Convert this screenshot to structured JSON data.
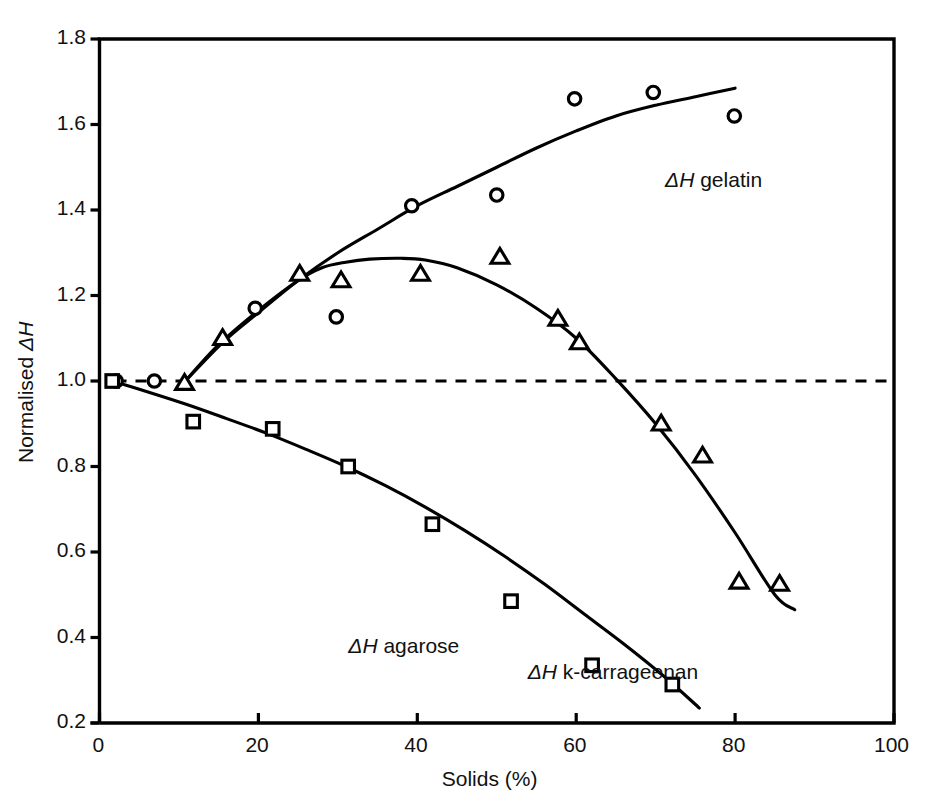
{
  "chart_data": {
    "type": "scatter",
    "title": "",
    "subtitle": "",
    "xlabel": "Solids (%)",
    "ylabel_prefix": "Normalised ",
    "ylabel_symbol": "ΔH",
    "xlim": [
      0,
      100
    ],
    "ylim": [
      0.2,
      1.8
    ],
    "xticks": [
      0,
      20,
      40,
      60,
      80,
      100
    ],
    "xticklabels": [
      "0",
      "20",
      "40",
      "60",
      "80",
      "100"
    ],
    "yticks": [
      0.2,
      0.4,
      0.6,
      0.8,
      1.0,
      1.2,
      1.4,
      1.6,
      1.8
    ],
    "yticklabels": [
      "0.2",
      "0.4",
      "0.6",
      "0.8",
      "1.0",
      "1.2",
      "1.4",
      "1.6",
      "1.8"
    ],
    "grid": false,
    "legend_position": "inline-annotations",
    "reference_line": {
      "y": 1.0,
      "style": "dashed",
      "color": "#000000"
    },
    "frame_color": "#000000",
    "series": [
      {
        "name": "ΔH gelatin",
        "marker": "circle",
        "label": "ΔH gelatin",
        "label_prefix": "ΔH",
        "label_suffix": " gelatin",
        "label_x": 80.0,
        "label_y": 1.465,
        "points": [
          {
            "x": 2.1,
            "y": 1.0
          },
          {
            "x": 6.9,
            "y": 1.0
          },
          {
            "x": 19.6,
            "y": 1.17
          },
          {
            "x": 29.8,
            "y": 1.15
          },
          {
            "x": 39.3,
            "y": 1.41
          },
          {
            "x": 50.0,
            "y": 1.435
          },
          {
            "x": 59.8,
            "y": 1.66
          },
          {
            "x": 69.7,
            "y": 1.675
          },
          {
            "x": 79.9,
            "y": 1.62
          }
        ],
        "fit_curve": [
          {
            "x": 10.8,
            "y": 1.0
          },
          {
            "x": 15.5,
            "y": 1.09
          },
          {
            "x": 20.0,
            "y": 1.16
          },
          {
            "x": 25.0,
            "y": 1.235
          },
          {
            "x": 30.0,
            "y": 1.3
          },
          {
            "x": 35.0,
            "y": 1.355
          },
          {
            "x": 40.0,
            "y": 1.41
          },
          {
            "x": 45.0,
            "y": 1.455
          },
          {
            "x": 50.0,
            "y": 1.5
          },
          {
            "x": 55.0,
            "y": 1.545
          },
          {
            "x": 60.0,
            "y": 1.585
          },
          {
            "x": 65.0,
            "y": 1.62
          },
          {
            "x": 70.0,
            "y": 1.645
          },
          {
            "x": 75.0,
            "y": 1.665
          },
          {
            "x": 80.0,
            "y": 1.685
          }
        ]
      },
      {
        "name": "ΔH k-carrageenan",
        "marker": "triangle",
        "label": "ΔH k-carrageenan",
        "label_prefix": "ΔH",
        "label_suffix": " k-carrageenan",
        "label_x": 76.8,
        "label_y": 0.315,
        "points": [
          {
            "x": 10.7,
            "y": 0.995
          },
          {
            "x": 15.5,
            "y": 1.1
          },
          {
            "x": 25.2,
            "y": 1.25
          },
          {
            "x": 30.4,
            "y": 1.235
          },
          {
            "x": 40.4,
            "y": 1.25
          },
          {
            "x": 50.4,
            "y": 1.29
          },
          {
            "x": 57.7,
            "y": 1.145
          },
          {
            "x": 60.4,
            "y": 1.09
          },
          {
            "x": 70.7,
            "y": 0.9
          },
          {
            "x": 75.9,
            "y": 0.825
          },
          {
            "x": 80.5,
            "y": 0.53
          },
          {
            "x": 85.6,
            "y": 0.525
          }
        ],
        "fit_curve": [
          {
            "x": 10.8,
            "y": 1.0
          },
          {
            "x": 15.0,
            "y": 1.085
          },
          {
            "x": 20.0,
            "y": 1.165
          },
          {
            "x": 25.0,
            "y": 1.235
          },
          {
            "x": 28.0,
            "y": 1.265
          },
          {
            "x": 31.0,
            "y": 1.278
          },
          {
            "x": 34.0,
            "y": 1.285
          },
          {
            "x": 38.0,
            "y": 1.287
          },
          {
            "x": 41.0,
            "y": 1.283
          },
          {
            "x": 45.0,
            "y": 1.265
          },
          {
            "x": 50.0,
            "y": 1.225
          },
          {
            "x": 55.0,
            "y": 1.17
          },
          {
            "x": 60.0,
            "y": 1.1
          },
          {
            "x": 65.0,
            "y": 1.005
          },
          {
            "x": 70.0,
            "y": 0.9
          },
          {
            "x": 75.0,
            "y": 0.78
          },
          {
            "x": 80.0,
            "y": 0.645
          },
          {
            "x": 85.0,
            "y": 0.5
          },
          {
            "x": 87.5,
            "y": 0.465
          }
        ]
      },
      {
        "name": "ΔH agarose",
        "marker": "square",
        "label": "ΔH agarose",
        "label_prefix": "ΔH",
        "label_suffix": " agarose",
        "label_x": 39.5,
        "label_y": 0.375,
        "points": [
          {
            "x": 1.6,
            "y": 1.0
          },
          {
            "x": 11.8,
            "y": 0.905
          },
          {
            "x": 21.8,
            "y": 0.888
          },
          {
            "x": 31.3,
            "y": 0.8
          },
          {
            "x": 41.9,
            "y": 0.665
          },
          {
            "x": 51.8,
            "y": 0.485
          },
          {
            "x": 62.0,
            "y": 0.335
          },
          {
            "x": 72.1,
            "y": 0.29
          }
        ],
        "fit_curve": [
          {
            "x": 1.6,
            "y": 1.0
          },
          {
            "x": 6.0,
            "y": 0.975
          },
          {
            "x": 11.0,
            "y": 0.945
          },
          {
            "x": 16.0,
            "y": 0.912
          },
          {
            "x": 21.0,
            "y": 0.878
          },
          {
            "x": 26.0,
            "y": 0.84
          },
          {
            "x": 31.0,
            "y": 0.8
          },
          {
            "x": 36.0,
            "y": 0.755
          },
          {
            "x": 41.0,
            "y": 0.705
          },
          {
            "x": 46.0,
            "y": 0.65
          },
          {
            "x": 51.0,
            "y": 0.59
          },
          {
            "x": 56.0,
            "y": 0.525
          },
          {
            "x": 61.0,
            "y": 0.455
          },
          {
            "x": 66.0,
            "y": 0.385
          },
          {
            "x": 71.0,
            "y": 0.31
          },
          {
            "x": 75.5,
            "y": 0.235
          }
        ]
      }
    ]
  }
}
